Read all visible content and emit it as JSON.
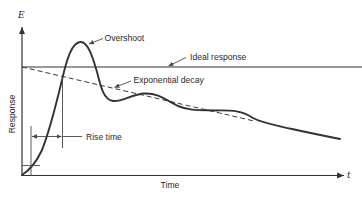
{
  "diagram": {
    "axes": {
      "y_symbol": "E",
      "x_symbol": "t",
      "y_label": "Response",
      "x_label": "Time"
    },
    "annotations": {
      "overshoot": "Overshoot",
      "ideal_response": "Ideal response",
      "exponential_decay": "Exponential decay",
      "rise_time": "Rise time"
    },
    "colors": {
      "ink": "#333333",
      "background": "#ffffff"
    }
  }
}
